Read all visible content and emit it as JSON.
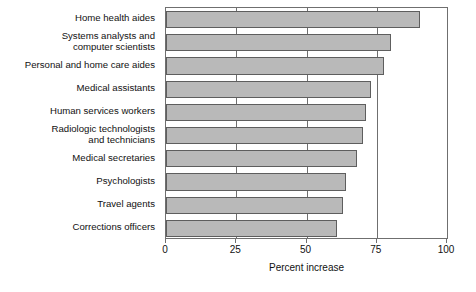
{
  "chart_data": {
    "type": "bar",
    "orientation": "horizontal",
    "title": "",
    "xlabel": "Percent increase",
    "ylabel": "",
    "xlim": [
      0,
      100
    ],
    "xticks": [
      0,
      25,
      50,
      75,
      100
    ],
    "xtick_labels": [
      "0",
      "25",
      "50",
      "75",
      "100"
    ],
    "grid": true,
    "grid_axis": "x",
    "legend": false,
    "bar_fill_color": "#b9b9b9",
    "bar_edge_color": "#5e5e5e",
    "axis_color": "#6f6f6f",
    "categories": [
      "Home health aides",
      "Systems analysts and\ncomputer scientists",
      "Personal and home care aides",
      "Medical assistants",
      "Human services workers",
      "Radiologic technologists\nand technicians",
      "Medical secretaries",
      "Psychologists",
      "Travel agents",
      "Corrections officers"
    ],
    "values": [
      90.5,
      80,
      77.5,
      73,
      71,
      70,
      68,
      64,
      63,
      61
    ]
  }
}
